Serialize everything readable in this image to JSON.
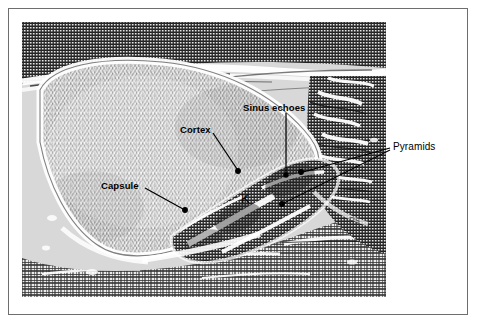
{
  "figure": {
    "type": "medical-ultrasound-annotated-figure",
    "modality": "B-mode ultrasound halftone print",
    "border_color": "#6e6e6e",
    "background_color": "#ffffff"
  },
  "annotations": [
    {
      "id": "sinus-echoes",
      "label": "Sinus echoes",
      "style": "bold",
      "leader": "vertical line descending to the bright central sinus complex"
    },
    {
      "id": "cortex",
      "label": "Cortex",
      "style": "bold",
      "leader": "diagonal line descending right to a dot on the cortical band"
    },
    {
      "id": "capsule",
      "label": "Capsule",
      "style": "bold",
      "leader": "diagonal line descending right to a dot on the renal capsule"
    },
    {
      "id": "pyramids",
      "label": "Pyramids",
      "style": "light",
      "leader": "two diagonal lines descending left to dots on two medullary pyramids"
    },
    {
      "id": "kidney-marker",
      "label": "K",
      "style": "marker",
      "leader": "none"
    },
    {
      "id": "ps-marker",
      "label": "Ps",
      "style": "faint",
      "leader": "none"
    }
  ],
  "colors": {
    "ink": "#000000",
    "leader_line": "#000000",
    "echo_dark": "#3a3a3a",
    "echo_mid": "#9a9a9a",
    "echo_bright": "#ffffff",
    "plate_rule": "#6e6e6e"
  }
}
